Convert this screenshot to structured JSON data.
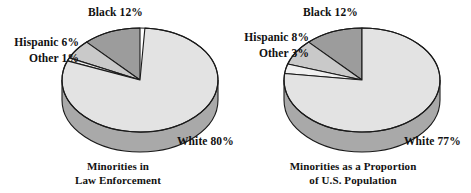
{
  "figure": {
    "background": "#ffffff",
    "text_color": "#111111"
  },
  "charts": [
    {
      "id": "law-enforcement",
      "caption_line1": "Minorities in",
      "caption_line2": "Law Enforcement",
      "labels": {
        "black": "Black 12%",
        "hispanic": "Hispanic 6%",
        "other": "Other 1%",
        "white": "White 80%"
      }
    },
    {
      "id": "us-population",
      "caption_line1": "Minorities as a Proportion",
      "caption_line2": "of U.S. Population",
      "labels": {
        "black": "Black 12%",
        "hispanic": "Hispanic 8%",
        "other": "Other 3%",
        "white": "White 77%"
      }
    }
  ],
  "chart_data": [
    {
      "type": "pie",
      "title": "Minorities in Law Enforcement",
      "categories": [
        "Black",
        "Hispanic",
        "Other",
        "White"
      ],
      "values": [
        12,
        6,
        1,
        80
      ],
      "value_labels": [
        "Black 12%",
        "Hispanic 6%",
        "Other 1%",
        "White 80%"
      ],
      "unit": "percent",
      "legend": "none",
      "style": "3d-pie",
      "colors": [
        "#9c9c9c",
        "#c9c9c9",
        "#f0f0f0",
        "#e3e3e3"
      ],
      "side_colors": [
        "#a9a9a9",
        "#a9a9a9",
        "#a9a9a9",
        "#a9a9a9"
      ],
      "start_angle_deg": 90,
      "direction": "counterclockwise"
    },
    {
      "type": "pie",
      "title": "Minorities as a Proportion of U.S. Population",
      "categories": [
        "Black",
        "Hispanic",
        "Other",
        "White"
      ],
      "values": [
        12,
        8,
        3,
        77
      ],
      "value_labels": [
        "Black 12%",
        "Hispanic 8%",
        "Other 3%",
        "White 77%"
      ],
      "unit": "percent",
      "legend": "none",
      "style": "3d-pie",
      "colors": [
        "#9c9c9c",
        "#c9c9c9",
        "#f0f0f0",
        "#e3e3e3"
      ],
      "side_colors": [
        "#a9a9a9",
        "#a9a9a9",
        "#a9a9a9",
        "#a9a9a9"
      ],
      "start_angle_deg": 90,
      "direction": "counterclockwise"
    }
  ]
}
